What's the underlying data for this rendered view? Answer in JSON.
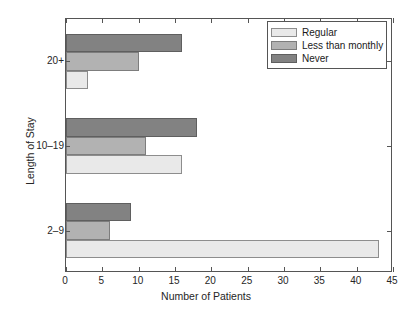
{
  "chart_data": {
    "type": "bar",
    "orientation": "horizontal",
    "title": "",
    "xlabel": "Number of Patients",
    "ylabel": "Length of Stay",
    "categories": [
      "2–9",
      "10–19",
      "20+"
    ],
    "series": [
      {
        "name": "Regular",
        "color": "#e9e9e9",
        "values": [
          43,
          16,
          3
        ]
      },
      {
        "name": "Less than monthly",
        "color": "#b2b2b2",
        "values": [
          6,
          11,
          10
        ]
      },
      {
        "name": "Never",
        "color": "#828282",
        "values": [
          9,
          18,
          16
        ]
      }
    ],
    "xlim": [
      0,
      45
    ],
    "xticks": [
      0,
      5,
      10,
      15,
      20,
      25,
      30,
      35,
      40,
      45
    ],
    "xticklabels": [
      "0",
      "5",
      "10",
      "15",
      "20",
      "25",
      "30",
      "35",
      "40",
      "45"
    ],
    "grid": false,
    "legend_position": "top-right",
    "legend_entries": [
      "Regular",
      "Less than monthly",
      "Never"
    ]
  }
}
